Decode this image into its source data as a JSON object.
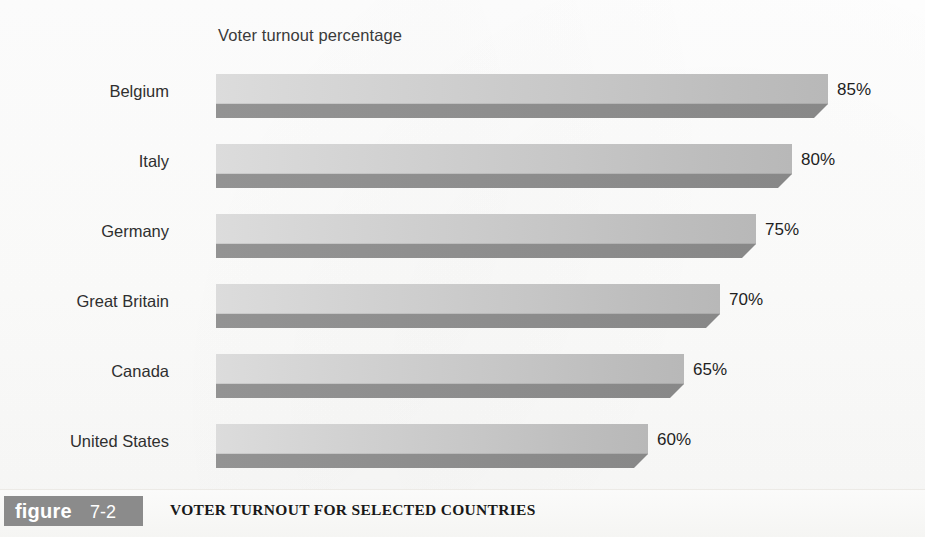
{
  "chart_data": {
    "type": "bar",
    "orientation": "horizontal",
    "title": "Voter turnout percentage",
    "xlabel": "",
    "ylabel": "",
    "categories": [
      "Belgium",
      "Italy",
      "Germany",
      "Great Britain",
      "Canada",
      "United States"
    ],
    "values": [
      85,
      80,
      75,
      70,
      65,
      60
    ],
    "value_labels": [
      "85%",
      "80%",
      "75%",
      "70%",
      "65%",
      "60%"
    ],
    "xlim": [
      0,
      85
    ],
    "grid": false,
    "legend": null,
    "style": "3d-horizontal-bars",
    "colors": {
      "bar_top_light": "#dcdcdc",
      "bar_top_dark": "#b8b8b8",
      "bar_front": "#8e8e8e",
      "text": "#2f2f2f",
      "background": "#fdfdfc"
    }
  },
  "figure": {
    "badge_word": "figure",
    "badge_number": "7-2",
    "caption": "VOTER TURNOUT FOR SELECTED COUNTRIES",
    "badge_color": "#8b8b8b"
  }
}
